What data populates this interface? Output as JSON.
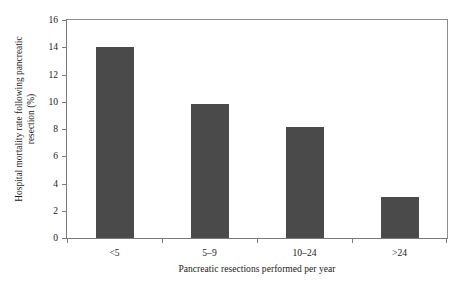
{
  "chart_data": {
    "type": "bar",
    "title": "",
    "categories": [
      "<5",
      "5–9",
      "10–24",
      ">24"
    ],
    "values": [
      14.0,
      9.85,
      8.15,
      3.0
    ],
    "series": [
      {
        "name": "Hospital mortality rate",
        "values": [
          14.0,
          9.85,
          8.15,
          3.0
        ]
      }
    ],
    "xlabel": "Pancreatic resections performed per year",
    "ylabel": "Hospital mortality rate following pancreatic\nresection (%)",
    "ylabel_lines": [
      "Hospital mortality rate following pancreatic",
      "resection (%)"
    ],
    "ylim": [
      0,
      16
    ],
    "yticks": [
      0,
      2,
      4,
      6,
      8,
      10,
      12,
      14,
      16
    ],
    "ytick_labels": [
      "0",
      "2",
      "4",
      "6",
      "8",
      "10",
      "12",
      "14",
      "16"
    ],
    "grid": false,
    "legend": null,
    "bar_color": "#4a4a4a",
    "axis_color": "#7a7a7a",
    "frame_color": "#8d8d8d",
    "background": "#ffffff"
  }
}
